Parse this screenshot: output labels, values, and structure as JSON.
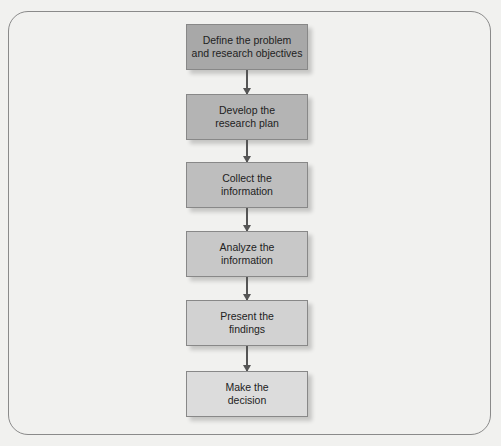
{
  "diagram": {
    "type": "vertical-flowchart",
    "steps": [
      {
        "label": "Define the problem\nand research objectives",
        "color": "#a8a8a8"
      },
      {
        "label": "Develop the\nresearch plan",
        "color": "#b4b4b4"
      },
      {
        "label": "Collect the\ninformation",
        "color": "#bebebe"
      },
      {
        "label": "Analyze the\ninformation",
        "color": "#c8c8c8"
      },
      {
        "label": "Present the\nfindings",
        "color": "#d2d2d2"
      },
      {
        "label": "Make the\ndecision",
        "color": "#dcdcdc"
      }
    ]
  }
}
